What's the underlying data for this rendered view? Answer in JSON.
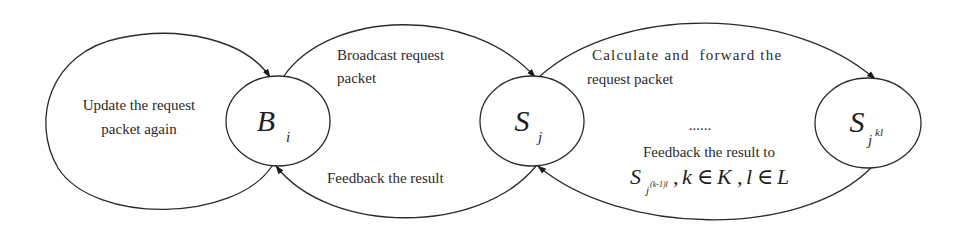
{
  "diagram": {
    "nodes": [
      {
        "id": "Bi",
        "main": "B",
        "sub": "i",
        "sup": ""
      },
      {
        "id": "Sj",
        "main": "S",
        "sub": "j",
        "sup": ""
      },
      {
        "id": "Sjkl",
        "main": "S",
        "sub": "j",
        "sup": "kl"
      }
    ],
    "edges": [
      {
        "id": "self-loop-Bi",
        "from": "Bi",
        "to": "Bi",
        "lines": [
          "Update the request",
          "packet again"
        ]
      },
      {
        "id": "Bi-to-Sj",
        "from": "Bi",
        "to": "Sj",
        "lines": [
          "Broadcast request",
          "packet"
        ]
      },
      {
        "id": "Sj-to-Bi",
        "from": "Sj",
        "to": "Bi",
        "lines": [
          "Feedback the result"
        ]
      },
      {
        "id": "Sj-to-Sjkl",
        "from": "Sj",
        "to": "Sjkl",
        "lines": [
          "Calculate and  forward the",
          "request packet"
        ]
      },
      {
        "id": "Sjkl-to-Sj",
        "from": "Sjkl",
        "to": "Sj",
        "lines": [
          "......",
          "Feedback the result to"
        ]
      }
    ],
    "formula": {
      "main": "S",
      "sub": "j",
      "sup": "(k-1)l",
      "rest_1": ",",
      "k": "k",
      "in_1": "∈",
      "K": "K",
      "comma": ",",
      "l": "l",
      "in_2": "∈",
      "L": "L"
    },
    "colors": {
      "stroke": "#2a2a2a",
      "text": "#2a2a2a",
      "background": "#ffffff"
    }
  }
}
